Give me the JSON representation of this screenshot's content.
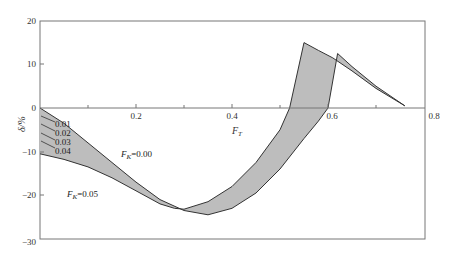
{
  "chart_data": {
    "type": "area",
    "title": "",
    "xlabel": "F_T",
    "ylabel": "δ/%",
    "xlim": [
      0,
      0.8
    ],
    "ylim": [
      -30,
      20
    ],
    "x_ticks": [
      "0.2",
      "0.4",
      "0.6",
      "0.8"
    ],
    "y_ticks": [
      "20",
      "10",
      "0",
      "-10",
      "-20",
      "-30"
    ],
    "grid": false,
    "legend": null,
    "series": [
      {
        "name": "F_K=0.00",
        "x": [
          0,
          0.05,
          0.1,
          0.15,
          0.2,
          0.25,
          0.3,
          0.35,
          0.4,
          0.45,
          0.5,
          0.55,
          0.58,
          0.6,
          0.62,
          0.65,
          0.7,
          0.76
        ],
        "y": [
          0,
          -3.5,
          -8,
          -12.5,
          -17,
          -21,
          -23.5,
          -24.5,
          -23,
          -19.5,
          -14,
          -7,
          -3,
          0,
          12.5,
          9.5,
          5,
          0.5
        ]
      },
      {
        "name": "F_K=0.05",
        "x": [
          0,
          0.05,
          0.1,
          0.15,
          0.2,
          0.25,
          0.28,
          0.3,
          0.35,
          0.4,
          0.45,
          0.5,
          0.52,
          0.55,
          0.58,
          0.61,
          0.65,
          0.7,
          0.76
        ],
        "y": [
          -10.5,
          -11.8,
          -13.5,
          -16,
          -19,
          -22,
          -23,
          -23.2,
          -21.5,
          -18,
          -12.5,
          -5,
          0,
          15,
          13.2,
          11.5,
          8.5,
          4.5,
          0.5
        ]
      }
    ],
    "band_fill": "#bdbdbd",
    "annotations": [
      {
        "text": "F_K=0.00",
        "x": 0.26,
        "y": -10
      },
      {
        "text": "F_K=0.05",
        "x": 0.08,
        "y": -19
      },
      {
        "text": "0.01",
        "x": 0.02,
        "y": -3
      },
      {
        "text": "0.02",
        "x": 0.02,
        "y": -5
      },
      {
        "text": "0.03",
        "x": 0.02,
        "y": -7
      },
      {
        "text": "0.04",
        "x": 0.02,
        "y": -9
      }
    ]
  },
  "labels": {
    "ylabel": "δ/%",
    "xlabel_main": "F",
    "xlabel_sub": "T",
    "fk0_main": "F",
    "fk0_sub": "K",
    "fk0_val": "=0.00",
    "fk5_main": "F",
    "fk5_sub": "K",
    "fk5_val": "=0.05",
    "inner": [
      "0.01",
      "0.02",
      "0.03",
      "0.04"
    ],
    "yt": [
      "20",
      "10",
      "0",
      "−10",
      "−20",
      "−30"
    ],
    "xt": [
      "0.2",
      "0.4",
      "0.6",
      "0.8"
    ]
  }
}
